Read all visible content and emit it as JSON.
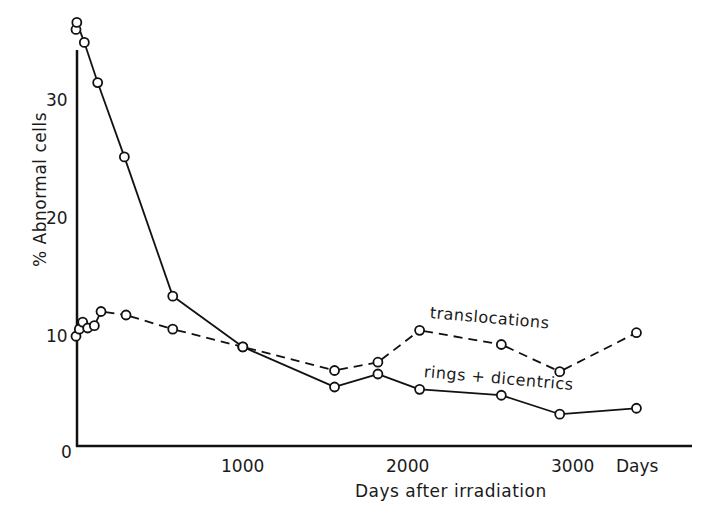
{
  "chart_data": {
    "type": "line",
    "title": "",
    "xlabel": "Days after irradiation",
    "ylabel": "% Abnormal cells",
    "x_unit_label": "Days",
    "xlim": [
      0,
      3700
    ],
    "ylim": [
      0,
      37
    ],
    "x_ticks": [
      0,
      1000,
      2000,
      3000
    ],
    "x_tick_labels": [
      "0",
      "1000",
      "2000",
      "3000"
    ],
    "y_ticks": [
      10,
      20,
      30
    ],
    "y_tick_labels": [
      "10",
      "20",
      "30"
    ],
    "grid": false,
    "legend": "inline labels",
    "series": [
      {
        "name": "rings + dicentrics",
        "style": "solid",
        "marker": "open-circle",
        "x": [
          0,
          5,
          50,
          130,
          290,
          580,
          1000,
          1550,
          1810,
          2060,
          2550,
          2900,
          3360
        ],
        "y": [
          35.3,
          35.9,
          34.2,
          30.8,
          24.5,
          12.7,
          8.4,
          5.0,
          6.1,
          4.8,
          4.3,
          2.7,
          3.2
        ]
      },
      {
        "name": "translocations",
        "style": "dashed",
        "marker": "open-circle",
        "x": [
          0,
          20,
          40,
          70,
          110,
          150,
          300,
          580,
          1000,
          1550,
          1810,
          2060,
          2550,
          2900,
          3360
        ],
        "y": [
          9.3,
          9.9,
          10.5,
          10.0,
          10.2,
          11.4,
          11.1,
          9.9,
          8.4,
          6.4,
          7.1,
          9.8,
          8.6,
          6.3,
          9.6
        ]
      }
    ]
  },
  "labels": {
    "y_axis": "% Abnormal cells",
    "x_axis": "Days after irradiation",
    "x_unit": "Days",
    "y_ticks": [
      "0",
      "10",
      "20",
      "30"
    ],
    "x_ticks": [
      "1000",
      "2000",
      "3000"
    ],
    "series_translocations": "translocations",
    "series_rings": "rings + dicentrics"
  }
}
